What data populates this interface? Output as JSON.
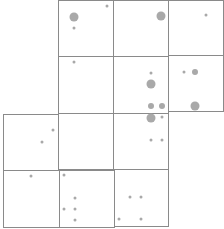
{
  "map": {
    "colors": {
      "background": "#ffffff",
      "grid_line": "#8a8a8a",
      "dot": "#a9a9a9"
    },
    "tiles": [
      {
        "row": 0,
        "col": 1,
        "x": 58,
        "y": 0,
        "w": 56,
        "h": 57
      },
      {
        "row": 0,
        "col": 2,
        "x": 113,
        "y": 0,
        "w": 56,
        "h": 57
      },
      {
        "row": 0,
        "col": 3,
        "x": 168,
        "y": 0,
        "w": 56,
        "h": 56
      },
      {
        "row": 1,
        "col": 1,
        "x": 58,
        "y": 56,
        "w": 56,
        "h": 58
      },
      {
        "row": 1,
        "col": 2,
        "x": 113,
        "y": 56,
        "w": 56,
        "h": 58
      },
      {
        "row": 1,
        "col": 3,
        "x": 168,
        "y": 55,
        "w": 56,
        "h": 57
      },
      {
        "row": 2,
        "col": 0,
        "x": 3,
        "y": 114,
        "w": 56,
        "h": 57
      },
      {
        "row": 2,
        "col": 1,
        "x": 58,
        "y": 113,
        "w": 56,
        "h": 57
      },
      {
        "row": 2,
        "col": 2,
        "x": 113,
        "y": 113,
        "w": 56,
        "h": 57
      },
      {
        "row": 3,
        "col": 0,
        "x": 3,
        "y": 170,
        "w": 57,
        "h": 58
      },
      {
        "row": 3,
        "col": 1,
        "x": 59,
        "y": 170,
        "w": 56,
        "h": 58
      },
      {
        "row": 3,
        "col": 2,
        "x": 114,
        "y": 169,
        "w": 55,
        "h": 58
      }
    ],
    "dots": [
      {
        "x": 107,
        "y": 6,
        "size": 3
      },
      {
        "x": 74,
        "y": 17,
        "size": 9
      },
      {
        "x": 74,
        "y": 28,
        "size": 3
      },
      {
        "x": 161,
        "y": 16,
        "size": 9
      },
      {
        "x": 206,
        "y": 15,
        "size": 3
      },
      {
        "x": 74,
        "y": 62,
        "size": 3
      },
      {
        "x": 151,
        "y": 73,
        "size": 3
      },
      {
        "x": 151,
        "y": 84,
        "size": 9
      },
      {
        "x": 151,
        "y": 106,
        "size": 6
      },
      {
        "x": 162,
        "y": 106,
        "size": 6
      },
      {
        "x": 184,
        "y": 72,
        "size": 3
      },
      {
        "x": 195,
        "y": 72,
        "size": 6
      },
      {
        "x": 195,
        "y": 106,
        "size": 9
      },
      {
        "x": 151,
        "y": 118,
        "size": 9
      },
      {
        "x": 162,
        "y": 117,
        "size": 3
      },
      {
        "x": 53,
        "y": 130,
        "size": 3
      },
      {
        "x": 42,
        "y": 142,
        "size": 3
      },
      {
        "x": 151,
        "y": 140,
        "size": 3
      },
      {
        "x": 162,
        "y": 140,
        "size": 3
      },
      {
        "x": 31,
        "y": 176,
        "size": 3
      },
      {
        "x": 64,
        "y": 175,
        "size": 3
      },
      {
        "x": 75,
        "y": 198,
        "size": 3
      },
      {
        "x": 64,
        "y": 209,
        "size": 3
      },
      {
        "x": 75,
        "y": 209,
        "size": 3
      },
      {
        "x": 75,
        "y": 220,
        "size": 3
      },
      {
        "x": 130,
        "y": 197,
        "size": 3
      },
      {
        "x": 141,
        "y": 197,
        "size": 3
      },
      {
        "x": 119,
        "y": 219,
        "size": 3
      },
      {
        "x": 141,
        "y": 219,
        "size": 3
      }
    ]
  }
}
